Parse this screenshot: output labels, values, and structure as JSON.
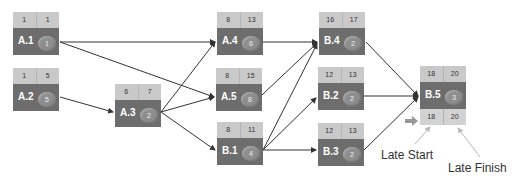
{
  "diagram": {
    "nodes": [
      {
        "id": "A.1",
        "late_start": "1",
        "late_finish": "1",
        "duration": "1"
      },
      {
        "id": "A.2",
        "late_start": "1",
        "late_finish": "5",
        "duration": "5"
      },
      {
        "id": "A.3",
        "late_start": "6",
        "late_finish": "7",
        "duration": "2"
      },
      {
        "id": "A.4",
        "late_start": "8",
        "late_finish": "13",
        "duration": "6"
      },
      {
        "id": "A.5",
        "late_start": "8",
        "late_finish": "15",
        "duration": "8"
      },
      {
        "id": "B.1",
        "late_start": "8",
        "late_finish": "11",
        "duration": "4"
      },
      {
        "id": "B.4",
        "late_start": "16",
        "late_finish": "17",
        "duration": "2"
      },
      {
        "id": "B.2",
        "late_start": "12",
        "late_finish": "13",
        "duration": "2"
      },
      {
        "id": "B.3",
        "late_start": "12",
        "late_finish": "13",
        "duration": "2"
      },
      {
        "id": "B.5",
        "late_start": "18",
        "late_finish": "20",
        "duration": "3",
        "bottom_start": "18",
        "bottom_finish": "20"
      }
    ],
    "edges": [
      [
        "A.1",
        "A.4"
      ],
      [
        "A.1",
        "A.5"
      ],
      [
        "A.2",
        "A.3"
      ],
      [
        "A.3",
        "A.4"
      ],
      [
        "A.3",
        "A.5"
      ],
      [
        "A.3",
        "B.1"
      ],
      [
        "A.4",
        "B.4"
      ],
      [
        "A.5",
        "B.4"
      ],
      [
        "B.1",
        "B.4"
      ],
      [
        "B.1",
        "B.2"
      ],
      [
        "B.1",
        "B.3"
      ],
      [
        "B.4",
        "B.5"
      ],
      [
        "B.2",
        "B.5"
      ],
      [
        "B.3",
        "B.5"
      ]
    ],
    "annotations": {
      "late_start": "Late Start",
      "late_finish": "Late Finish"
    },
    "colors": {
      "header": "#c9c9c9",
      "body": "#6d6d6d",
      "circle": "#8e8e8e",
      "line": "#333333",
      "pointer": "#aaaaaa"
    }
  }
}
